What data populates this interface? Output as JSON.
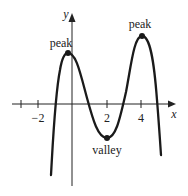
{
  "diagram": {
    "type": "function-graph",
    "x_axis_label": "x",
    "y_axis_label": "y",
    "x_ticks": [
      {
        "value": -3,
        "label": ""
      },
      {
        "value": -2,
        "label": "−2"
      },
      {
        "value": 2,
        "label": "2"
      },
      {
        "value": 4,
        "label": "4"
      }
    ],
    "annotations": [
      {
        "label": "peak",
        "point": [
          -0.3,
          3
        ],
        "kind": "local maximum"
      },
      {
        "label": "valley",
        "point": [
          2,
          -2
        ],
        "kind": "local minimum"
      },
      {
        "label": "peak",
        "point": [
          4,
          4
        ],
        "kind": "local maximum"
      }
    ],
    "x_intercepts_approx": [
      -1,
      1,
      3,
      5
    ],
    "colors": {
      "curve": "#1a1a1a",
      "axes": "#222222",
      "background": "#ffffff"
    }
  }
}
